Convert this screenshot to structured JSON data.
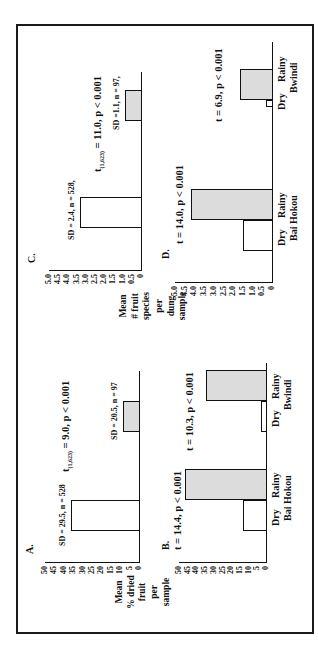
{
  "figure": {
    "orientation": "rotated-90-ccw",
    "panels": {
      "A": {
        "letter": "A.",
        "ylabel_lines": [
          "Mean",
          "% dried",
          "fruit"
        ],
        "yticks": [
          "50",
          "45",
          "40",
          "35",
          "30",
          "25",
          "20",
          "15",
          "10",
          "5",
          "0"
        ],
        "bars": [
          {
            "value": 36,
            "fill": "white",
            "annotation": "SD = 29.5,  n = 528"
          },
          {
            "value": 8.5,
            "fill": "gray",
            "annotation": "SD = 20.5, n = 97"
          }
        ],
        "stat_prefix": "t",
        "stat_sub": "(1,623)",
        "stat_rest": " = 9.0, p < 0.001"
      },
      "B": {
        "letter": "B.",
        "ylabel_lines": [
          "per",
          "sample"
        ],
        "yticks": [
          "50",
          "45",
          "40",
          "35",
          "30",
          "25",
          "20",
          "15",
          "10",
          "5",
          "0"
        ],
        "groups": [
          {
            "site": "Bai Hokou",
            "stat": "t = 14.4, p < 0.001",
            "bars": [
              {
                "label": "Dry",
                "value": 13,
                "fill": "white"
              },
              {
                "label": "Rainy",
                "value": 46.5,
                "fill": "gray"
              }
            ]
          },
          {
            "site": "Bwindi",
            "stat": "t = 10.3, p < 0.001",
            "bars": [
              {
                "label": "Dry",
                "value": 3,
                "fill": "white"
              },
              {
                "label": "Rainy",
                "value": 34.5,
                "fill": "gray"
              }
            ]
          }
        ]
      },
      "C": {
        "letter": "C.",
        "ylabel_lines": [
          "Mean",
          "# fruit",
          "species"
        ],
        "yticks": [
          "5.0",
          "4.5",
          "4.0",
          "3.5",
          "3.0",
          "2.5",
          "2.0",
          "1.5",
          "1.0",
          "0.5",
          "0"
        ],
        "bars": [
          {
            "value": 3.3,
            "fill": "white",
            "annotation": "SD = 2.4, n = 528,"
          },
          {
            "value": 0.9,
            "fill": "gray",
            "annotation": "SD =1.1, n = 97,"
          }
        ],
        "stat_prefix": "t",
        "stat_sub": "(1,623)",
        "stat_rest": " = 11.0, p < 0.001"
      },
      "D": {
        "letter": "D.",
        "ylabel_lines": [
          "per",
          "dung",
          "sample"
        ],
        "yticks": [
          "5.0",
          "4.5",
          "4.0",
          "3.5",
          "3.0",
          "2.5",
          "2.0",
          "1.5",
          "1.0",
          "0.5",
          "0"
        ],
        "groups": [
          {
            "site": "Bai Hokou",
            "stat": "t = 14.0, p < 0.001",
            "bars": [
              {
                "label": "Dry",
                "value": 1.5,
                "fill": "white"
              },
              {
                "label": "Rainy",
                "value": 4.2,
                "fill": "gray"
              }
            ]
          },
          {
            "site": "Bwindi",
            "stat": "t = 6.9, p < 0.001",
            "bars": [
              {
                "label": "Dry",
                "value": 0.3,
                "fill": "white"
              },
              {
                "label": "Rainy",
                "value": 1.65,
                "fill": "gray"
              }
            ]
          }
        ]
      }
    }
  },
  "chart_data": [
    {
      "type": "bar",
      "title": "A.",
      "ylabel": "Mean % dried fruit per sample",
      "categories": [
        "All samples (n = 528)",
        "Subset (n = 97)"
      ],
      "values": [
        36,
        8.5
      ],
      "annotations": [
        "SD = 29.5, n = 528",
        "SD = 20.5, n = 97",
        "t (1,623) = 9.0, p < 0.001"
      ],
      "ylim": [
        0,
        50
      ],
      "yticks": [
        0,
        5,
        10,
        15,
        20,
        25,
        30,
        35,
        40,
        45,
        50
      ]
    },
    {
      "type": "bar",
      "title": "B.",
      "ylabel": "Mean % dried fruit per sample",
      "categories": [
        "Bai Hokou Dry",
        "Bai Hokou Rainy",
        "Bwindi Dry",
        "Bwindi Rainy"
      ],
      "series": [
        {
          "name": "Mean % dried fruit",
          "values": [
            13,
            46.5,
            3,
            34.5
          ]
        }
      ],
      "annotations": [
        "Bai Hokou: t = 14.4, p < 0.001",
        "Bwindi: t = 10.3, p < 0.001"
      ],
      "ylim": [
        0,
        50
      ],
      "yticks": [
        0,
        5,
        10,
        15,
        20,
        25,
        30,
        35,
        40,
        45,
        50
      ]
    },
    {
      "type": "bar",
      "title": "C.",
      "ylabel": "Mean # fruit species per dung sample",
      "categories": [
        "All samples (n = 528)",
        "Subset (n = 97)"
      ],
      "values": [
        3.3,
        0.9
      ],
      "annotations": [
        "SD = 2.4, n = 528",
        "SD = 1.1, n = 97",
        "t (1,623) = 11.0, p < 0.001"
      ],
      "ylim": [
        0,
        5.0
      ],
      "yticks": [
        0,
        0.5,
        1.0,
        1.5,
        2.0,
        2.5,
        3.0,
        3.5,
        4.0,
        4.5,
        5.0
      ]
    },
    {
      "type": "bar",
      "title": "D.",
      "ylabel": "Mean # fruit species per dung sample",
      "categories": [
        "Bai Hokou Dry",
        "Bai Hokou Rainy",
        "Bwindi Dry",
        "Bwindi Rainy"
      ],
      "series": [
        {
          "name": "Mean # fruit species",
          "values": [
            1.5,
            4.2,
            0.3,
            1.65
          ]
        }
      ],
      "annotations": [
        "Bai Hokou: t = 14.0, p < 0.001",
        "Bwindi: t = 6.9, p < 0.001"
      ],
      "ylim": [
        0,
        5.0
      ],
      "yticks": [
        0,
        0.5,
        1.0,
        1.5,
        2.0,
        2.5,
        3.0,
        3.5,
        4.0,
        4.5,
        5.0
      ]
    }
  ]
}
